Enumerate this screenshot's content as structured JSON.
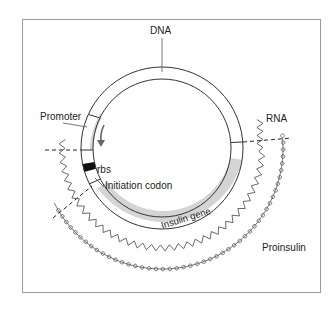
{
  "diagram": {
    "type": "plasmid transcription/translation schematic",
    "labels": {
      "dna": "DNA",
      "promoter": "Promoter",
      "rbs": "rbs",
      "initiation_codon": "Initiation codon",
      "insulin_gene": "Insulin gene",
      "rna": "RNA",
      "proinsulin": "Proinsulin"
    },
    "colors": {
      "line": "#333333",
      "gene_fill": "#d4d4d4",
      "rbs_fill": "#111111",
      "arrow": "#666666",
      "frame": "#9a9a9a"
    }
  }
}
